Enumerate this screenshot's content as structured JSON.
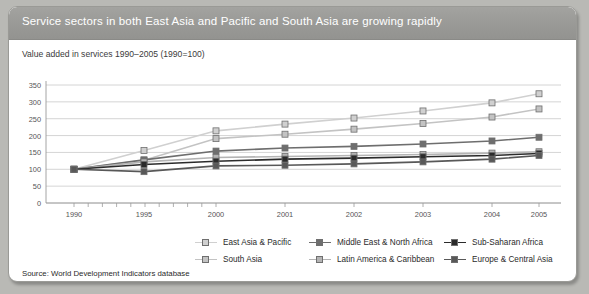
{
  "figure": {
    "title": "Service sectors in both East Asia and Pacific and South Asia are growing rapidly",
    "subtitle": "Value added in services 1990–2005 (1990=100)",
    "source": "Source: World Development Indicators database"
  },
  "colors": {
    "title_bar": "#9a9a97",
    "panel_bg": "#ffffff",
    "page_bg": "#b9b9b5",
    "gridline": "#c9c9c9",
    "axis": "#9a9a9a",
    "east_asia_pacific": "#d0d0d0",
    "south_asia": "#c3c3c3",
    "middle_east_north_africa": "#6e6e6e",
    "latin_america_caribbean": "#b4b4b4",
    "sub_saharan_africa": "#2b2b2b",
    "europe_central_asia": "#585858"
  },
  "chart_data": {
    "type": "line",
    "title": "Value added in services 1990–2005 (1990=100)",
    "xlabel": "",
    "ylabel": "",
    "categories": [
      "1990",
      "1995",
      "2000",
      "2001",
      "2002",
      "2003",
      "2004",
      "2005"
    ],
    "ylim": [
      0,
      350
    ],
    "yticks": [
      0,
      50,
      100,
      150,
      200,
      250,
      300,
      350
    ],
    "grid": true,
    "legend_position": "bottom",
    "series": [
      {
        "name": "East Asia & Pacific",
        "color": "#d0d0d0",
        "values": [
          100,
          156,
          214,
          234,
          252,
          273,
          297,
          324
        ]
      },
      {
        "name": "South Asia",
        "color": "#c3c3c3",
        "values": [
          100,
          127,
          191,
          204,
          219,
          236,
          255,
          279
        ]
      },
      {
        "name": "Middle East & North Africa",
        "color": "#6e6e6e",
        "values": [
          100,
          128,
          154,
          163,
          168,
          175,
          184,
          195
        ]
      },
      {
        "name": "Latin America & Caribbean",
        "color": "#b4b4b4",
        "values": [
          100,
          122,
          135,
          138,
          141,
          144,
          148,
          152
        ]
      },
      {
        "name": "Sub-Saharan Africa",
        "color": "#2b2b2b",
        "values": [
          100,
          114,
          124,
          130,
          133,
          137,
          141,
          147
        ]
      },
      {
        "name": "Europe & Central Asia",
        "color": "#585858",
        "values": [
          100,
          93,
          110,
          112,
          116,
          122,
          130,
          141
        ]
      }
    ]
  },
  "legend": [
    {
      "label": "East Asia & Pacific",
      "color": "#d0d0d0"
    },
    {
      "label": "Middle East & North Africa",
      "color": "#6e6e6e"
    },
    {
      "label": "Sub-Saharan Africa",
      "color": "#2b2b2b"
    },
    {
      "label": "South Asia",
      "color": "#c3c3c3"
    },
    {
      "label": "Latin America & Caribbean",
      "color": "#b4b4b4"
    },
    {
      "label": "Europe & Central Asia",
      "color": "#585858"
    }
  ]
}
